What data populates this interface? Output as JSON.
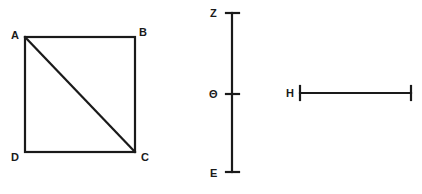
{
  "square": {
    "vertices": {
      "A": {
        "label": "A",
        "x": 25,
        "y": 37
      },
      "B": {
        "label": "B",
        "x": 135,
        "y": 37
      },
      "C": {
        "label": "C",
        "x": 135,
        "y": 152
      },
      "D": {
        "label": "D",
        "x": 25,
        "y": 152
      }
    },
    "diagonal": "AC"
  },
  "vertical_segment": {
    "top_label": "Z",
    "middle_label": "Θ",
    "bottom_label": "E",
    "x": 232,
    "y_top": 13,
    "y_mid": 94,
    "y_bottom": 172
  },
  "horizontal_segment": {
    "left_label": "H",
    "x_left": 300,
    "x_right": 411,
    "y": 93
  },
  "colors": {
    "stroke": "#1a1a1a",
    "background": "#ffffff"
  }
}
